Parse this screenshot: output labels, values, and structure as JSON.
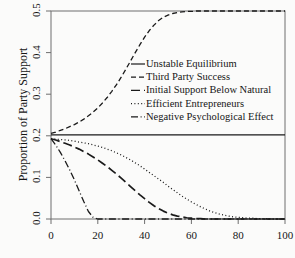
{
  "chart_data": {
    "type": "line",
    "title": "",
    "xlabel": "",
    "ylabel": "Proportion of Party Support",
    "xlim": [
      0,
      100
    ],
    "ylim": [
      0.0,
      0.5
    ],
    "grid": false,
    "legend_position": "center",
    "xticks": [
      "0",
      "20",
      "40",
      "60",
      "80",
      "100"
    ],
    "xtick_values": [
      0,
      20,
      40,
      60,
      80,
      100
    ],
    "yticks": [
      "0.0",
      "0.1",
      "0.2",
      "0.3",
      "0.4",
      "0.5"
    ],
    "ytick_values": [
      0.0,
      0.1,
      0.2,
      0.3,
      0.4,
      0.5
    ],
    "x": [
      0,
      2,
      4,
      6,
      8,
      10,
      12,
      14,
      16,
      18,
      20,
      22,
      24,
      26,
      28,
      30,
      32,
      34,
      36,
      38,
      40,
      42,
      44,
      46,
      48,
      50,
      52,
      54,
      56,
      58,
      60,
      62,
      64,
      66,
      68,
      70,
      72,
      74,
      76,
      78,
      80,
      82,
      84,
      86,
      88,
      90,
      92,
      94,
      96,
      98,
      100
    ],
    "series": [
      {
        "name": "Unstable Equilibrium",
        "style": "solid",
        "color": "#1a1a1a",
        "values": [
          0.202,
          0.202,
          0.202,
          0.202,
          0.202,
          0.202,
          0.202,
          0.202,
          0.202,
          0.202,
          0.202,
          0.202,
          0.202,
          0.202,
          0.202,
          0.202,
          0.202,
          0.202,
          0.202,
          0.202,
          0.202,
          0.202,
          0.202,
          0.202,
          0.202,
          0.202,
          0.202,
          0.202,
          0.202,
          0.202,
          0.202,
          0.202,
          0.202,
          0.202,
          0.202,
          0.202,
          0.202,
          0.202,
          0.202,
          0.202,
          0.202,
          0.202,
          0.202,
          0.202,
          0.202,
          0.202,
          0.202,
          0.202,
          0.202,
          0.202,
          0.202
        ]
      },
      {
        "name": "Third Party Success",
        "style": "dashed",
        "color": "#1a1a1a",
        "values": [
          0.206,
          0.209,
          0.213,
          0.217,
          0.222,
          0.227,
          0.233,
          0.24,
          0.248,
          0.257,
          0.267,
          0.279,
          0.292,
          0.307,
          0.323,
          0.341,
          0.36,
          0.38,
          0.4,
          0.419,
          0.437,
          0.453,
          0.466,
          0.477,
          0.485,
          0.49,
          0.494,
          0.496,
          0.498,
          0.499,
          0.499,
          0.5,
          0.5,
          0.5,
          0.5,
          0.5,
          0.5,
          0.5,
          0.5,
          0.5,
          0.5,
          0.5,
          0.5,
          0.5,
          0.5,
          0.5,
          0.5,
          0.5,
          0.5,
          0.5,
          0.5
        ]
      },
      {
        "name": "Initial Support Below Natural",
        "style": "longdash",
        "color": "#1a1a1a",
        "values": [
          0.193,
          0.19,
          0.186,
          0.182,
          0.178,
          0.173,
          0.168,
          0.162,
          0.156,
          0.149,
          0.142,
          0.134,
          0.126,
          0.117,
          0.108,
          0.098,
          0.088,
          0.078,
          0.068,
          0.058,
          0.049,
          0.04,
          0.032,
          0.025,
          0.019,
          0.014,
          0.01,
          0.007,
          0.005,
          0.003,
          0.002,
          0.001,
          0.001,
          0.0,
          0.0,
          0.0,
          0.0,
          0.0,
          0.0,
          0.0,
          0.0,
          0.0,
          0.0,
          0.0,
          0.0,
          0.0,
          0.0,
          0.0,
          0.0,
          0.0,
          0.0
        ]
      },
      {
        "name": "Efficient Entrepreneurs",
        "style": "dotted",
        "color": "#1a1a1a",
        "values": [
          0.193,
          0.192,
          0.191,
          0.19,
          0.189,
          0.187,
          0.185,
          0.183,
          0.181,
          0.178,
          0.175,
          0.172,
          0.168,
          0.164,
          0.159,
          0.154,
          0.148,
          0.142,
          0.135,
          0.128,
          0.12,
          0.112,
          0.104,
          0.096,
          0.088,
          0.079,
          0.071,
          0.063,
          0.055,
          0.048,
          0.041,
          0.035,
          0.029,
          0.024,
          0.019,
          0.015,
          0.012,
          0.009,
          0.007,
          0.005,
          0.004,
          0.003,
          0.002,
          0.002,
          0.001,
          0.001,
          0.001,
          0.0,
          0.0,
          0.0,
          0.0
        ]
      },
      {
        "name": "Negative Psychological Effect",
        "style": "dashdot",
        "color": "#1a1a1a",
        "values": [
          0.193,
          0.178,
          0.16,
          0.14,
          0.118,
          0.094,
          0.068,
          0.042,
          0.018,
          0.004,
          0.0,
          0.0,
          0.0,
          0.0,
          0.0,
          0.0,
          0.0,
          0.0,
          0.0,
          0.0,
          0.0,
          0.0,
          0.0,
          0.0,
          0.0,
          0.0,
          0.0,
          0.0,
          0.0,
          0.0,
          0.0,
          0.0,
          0.0,
          0.0,
          0.0,
          0.0,
          0.0,
          0.0,
          0.0,
          0.0,
          0.0,
          0.0,
          0.0,
          0.0,
          0.0,
          0.0,
          0.0,
          0.0,
          0.0,
          0.0,
          0.0
        ]
      }
    ]
  },
  "legend": {
    "entries": [
      {
        "label": "Unstable Equilibrium",
        "style": "solid"
      },
      {
        "label": "Third Party Success",
        "style": "dashed"
      },
      {
        "label": "Initial Support Below Natural",
        "style": "longdash"
      },
      {
        "label": "Efficient Entrepreneurs",
        "style": "dotted"
      },
      {
        "label": "Negative Psychological Effect",
        "style": "dashdot"
      }
    ]
  }
}
